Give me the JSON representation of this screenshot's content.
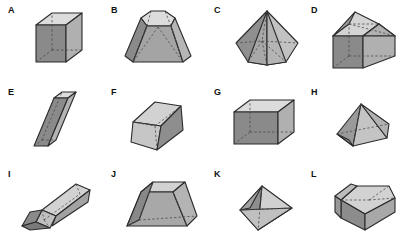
{
  "figure": {
    "background_color": "#ffffff",
    "grid": {
      "columns": 4,
      "rows": 3
    },
    "palette": {
      "outline": "#2b2b2b",
      "hidden_edge": "#4a4a4a",
      "face_light": "#dcdcdc",
      "face_mid": "#b0b0b0",
      "face_dark": "#8a8a8a",
      "face_darker": "#767676",
      "label_color": "#111111"
    }
  },
  "shapes": [
    {
      "label": "A",
      "name": "cube",
      "description": "Cube drawn in parallel projection with dashed hidden edges",
      "faces": {
        "top": "#dcdcdc",
        "left": "#8a8a8a",
        "right": "#b0b0b0"
      }
    },
    {
      "label": "B",
      "name": "hexagonal-frustum",
      "description": "Truncated pyramid with hexagonal base and small top face",
      "faces": {
        "top": "#dcdcdc",
        "left": "#8a8a8a",
        "right": "#b0b0b0"
      }
    },
    {
      "label": "C",
      "name": "hexagonal-pyramid",
      "description": "Hexagonal pyramid with apex at top and dashed hidden base edges",
      "faces": {
        "top": "#dcdcdc",
        "left": "#8a8a8a",
        "right": "#b0b0b0"
      }
    },
    {
      "label": "D",
      "name": "house-prism-with-hip-roof",
      "description": "Rectangular prism topped by a hip roof pyramid",
      "faces": {
        "top": "#dcdcdc",
        "left": "#8a8a8a",
        "right": "#b0b0b0"
      }
    },
    {
      "label": "E",
      "name": "oblique-prism",
      "description": "Leaning oblique rectangular prism (parallelepiped)",
      "faces": {
        "top": "#dcdcdc",
        "left": "#8a8a8a",
        "right": "#b0b0b0"
      }
    },
    {
      "label": "F",
      "name": "tilted-cube",
      "description": "Cube tilted and viewed from a corner angle",
      "faces": {
        "top": "#dcdcdc",
        "left": "#b0b0b0",
        "right": "#8a8a8a"
      }
    },
    {
      "label": "G",
      "name": "rectangular-box",
      "description": "Wide rectangular prism (cuboid) with dashed hidden edges",
      "faces": {
        "top": "#dcdcdc",
        "left": "#8a8a8a",
        "right": "#b0b0b0"
      }
    },
    {
      "label": "H",
      "name": "low-rectangular-pyramid",
      "description": "Squat rectangular pyramid with low apex",
      "faces": {
        "top": "#dcdcdc",
        "left": "#8a8a8a",
        "right": "#b0b0b0"
      }
    },
    {
      "label": "I",
      "name": "elongated-prism-with-point",
      "description": "Long pencil-like prism with a darker pointed tip",
      "faces": {
        "top": "#dcdcdc",
        "left": "#b0b0b0",
        "right": "#8a8a8a"
      }
    },
    {
      "label": "J",
      "name": "square-frustum",
      "description": "Truncated pyramid with square base, wider than tall",
      "faces": {
        "top": "#dcdcdc",
        "left": "#8a8a8a",
        "right": "#b0b0b0"
      }
    },
    {
      "label": "K",
      "name": "tetrahedron",
      "description": "Triangular pyramid viewed at an angle with dashed hidden edge",
      "faces": {
        "top": "#dcdcdc",
        "left": "#8a8a8a",
        "right": "#b0b0b0"
      }
    },
    {
      "label": "L",
      "name": "pentagonal-prism",
      "description": "Pentagonal prism seen from above showing the top face",
      "faces": {
        "top": "#dcdcdc",
        "left": "#8a8a8a",
        "right": "#b0b0b0"
      }
    }
  ]
}
